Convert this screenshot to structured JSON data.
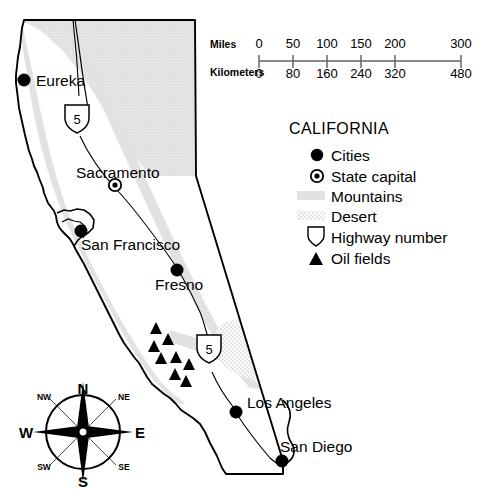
{
  "map": {
    "title": "California",
    "scale_bar": {
      "miles_label": "Miles",
      "kilometers_label": "Kilometers",
      "miles_ticks": [
        "0",
        "50",
        "100",
        "150",
        "200",
        "300"
      ],
      "kilometers_ticks": [
        "0",
        "80",
        "160",
        "240",
        "320",
        "480"
      ]
    },
    "legend": {
      "title": "CALIFORNIA",
      "items": [
        {
          "symbol": "filled-circle-icon",
          "label": "Cities"
        },
        {
          "symbol": "circle-dot-icon",
          "label": "State capital"
        },
        {
          "symbol": "gray-swatch-icon",
          "label": "Mountains"
        },
        {
          "symbol": "stipple-swatch-icon",
          "label": "Desert"
        },
        {
          "symbol": "highway-shield-icon",
          "label": "Highway number"
        },
        {
          "symbol": "filled-triangle-icon",
          "label": "Oil fields"
        }
      ]
    },
    "cities": [
      {
        "name": "Eureka",
        "type": "city",
        "x": 24,
        "y": 80
      },
      {
        "name": "Sacramento",
        "type": "capital",
        "x": 115,
        "y": 185
      },
      {
        "name": "San Francisco",
        "type": "city",
        "x": 81,
        "y": 231
      },
      {
        "name": "Fresno",
        "type": "city",
        "x": 177,
        "y": 270
      },
      {
        "name": "Los Angeles",
        "type": "city",
        "x": 236,
        "y": 412
      },
      {
        "name": "San Diego",
        "type": "city",
        "x": 282,
        "y": 461
      }
    ],
    "highways": [
      {
        "number": "5",
        "x": 77,
        "y": 118
      },
      {
        "number": "5",
        "x": 209,
        "y": 348
      }
    ],
    "oil_fields_count": 8,
    "compass": {
      "north": "N",
      "northeast": "NE",
      "east": "E",
      "southeast": "SE",
      "south": "S",
      "southwest": "SW",
      "west": "W",
      "northwest": "NW"
    },
    "colors": {
      "mountains": "#e2e2e2",
      "desert_dot": "#c9c9c9",
      "outline": "#000000",
      "background": "#ffffff",
      "marker": "#000000"
    }
  }
}
